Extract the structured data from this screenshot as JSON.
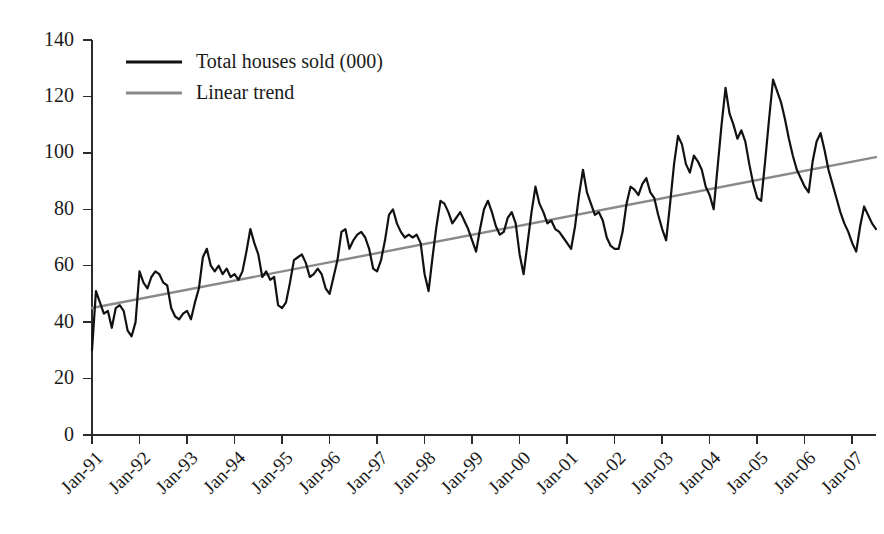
{
  "chart_data": {
    "type": "line",
    "title": "",
    "subtitle": "",
    "xlabel": "",
    "ylabel": "",
    "ylim": [
      0,
      140
    ],
    "ytick_step": 20,
    "ytick_labels": [
      "0",
      "20",
      "40",
      "60",
      "80",
      "100",
      "120",
      "140"
    ],
    "ytick_values": [
      0,
      20,
      40,
      60,
      80,
      100,
      120,
      140
    ],
    "xtick_labels": [
      "Jan-91",
      "Jan-92",
      "Jan-93",
      "Jan-94",
      "Jan-95",
      "Jan-96",
      "Jan-97",
      "Jan-98",
      "Jan-99",
      "Jan-00",
      "Jan-01",
      "Jan-02",
      "Jan-03",
      "Jan-04",
      "Jan-05",
      "Jan-06",
      "Jan-07"
    ],
    "xtick_rotation_deg": 45,
    "grid": false,
    "legend_position": "top-left",
    "x_start_label": "Jan-91",
    "x_end_label": "Jul-07",
    "n_points": 199,
    "series": [
      {
        "name": "Total houses sold (000)",
        "color": "#111111",
        "style": "solid",
        "values": [
          30,
          51,
          47,
          43,
          44,
          38,
          45,
          46,
          44,
          37,
          35,
          40,
          58,
          54,
          52,
          56,
          58,
          57,
          54,
          53,
          45,
          42,
          41,
          43,
          44,
          41,
          47,
          52,
          63,
          66,
          60,
          58,
          60,
          57,
          59,
          56,
          57,
          55,
          58,
          65,
          73,
          68,
          64,
          56,
          58,
          55,
          56,
          46,
          45,
          47,
          54,
          62,
          63,
          64,
          61,
          56,
          57,
          59,
          57,
          52,
          50,
          56,
          62,
          72,
          73,
          66,
          69,
          71,
          72,
          70,
          66,
          59,
          58,
          62,
          69,
          78,
          80,
          75,
          72,
          70,
          71,
          70,
          71,
          68,
          57,
          51,
          63,
          74,
          83,
          82,
          79,
          75,
          77,
          79,
          76,
          73,
          69,
          65,
          73,
          80,
          83,
          79,
          74,
          71,
          72,
          77,
          79,
          75,
          64,
          57,
          68,
          79,
          88,
          82,
          79,
          75,
          76,
          73,
          72,
          70,
          68,
          66,
          74,
          85,
          94,
          86,
          82,
          78,
          79,
          76,
          70,
          67,
          66,
          66,
          72,
          82,
          88,
          87,
          85,
          89,
          91,
          86,
          84,
          78,
          73,
          69,
          82,
          96,
          106,
          103,
          96,
          93,
          99,
          97,
          94,
          88,
          85,
          80,
          95,
          110,
          123,
          114,
          110,
          105,
          108,
          104,
          96,
          89,
          84,
          83,
          97,
          112,
          126,
          122,
          118,
          112,
          105,
          99,
          94,
          91,
          88,
          86,
          97,
          104,
          107,
          101,
          94,
          89,
          84,
          79,
          75,
          72,
          68,
          65,
          74,
          81,
          78,
          75,
          73
        ]
      },
      {
        "name": "Linear trend",
        "color": "#8a8a8a",
        "style": "solid",
        "endpoints": [
          45.0,
          98.5
        ],
        "description": "Straight linear trend line from about 45 at Jan-91 to about 98.5 at the right edge"
      }
    ],
    "legend": [
      {
        "label": "Total houses sold (000)",
        "color": "#111111",
        "swatch": "line"
      },
      {
        "label": "Linear trend",
        "color": "#8a8a8a",
        "swatch": "line"
      }
    ]
  },
  "axes": {
    "y_axis_name": "y-axis",
    "x_axis_name": "x-axis"
  }
}
